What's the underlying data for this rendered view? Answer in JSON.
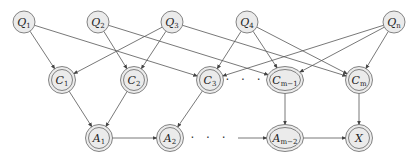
{
  "diagram": {
    "type": "directed-graph",
    "colors": {
      "node_fill": "#ebebeb",
      "stroke": "#666666",
      "edge": "#555555"
    },
    "nodes": [
      {
        "id": "Q1",
        "base": "Q",
        "sub": "1",
        "x": 24,
        "y": 22,
        "rx": 11,
        "ry": 11,
        "double": false
      },
      {
        "id": "Q2",
        "base": "Q",
        "sub": "2",
        "x": 98,
        "y": 22,
        "rx": 11,
        "ry": 11,
        "double": false
      },
      {
        "id": "Q3",
        "base": "Q",
        "sub": "3",
        "x": 172,
        "y": 22,
        "rx": 11,
        "ry": 11,
        "double": false
      },
      {
        "id": "Q4",
        "base": "Q",
        "sub": "4",
        "x": 247,
        "y": 22,
        "rx": 11,
        "ry": 11,
        "double": false
      },
      {
        "id": "Qn",
        "base": "Q",
        "sub": "n",
        "x": 394,
        "y": 22,
        "rx": 11,
        "ry": 11,
        "double": false
      },
      {
        "id": "C1",
        "base": "C",
        "sub": "1",
        "x": 62,
        "y": 80,
        "rx": 12,
        "ry": 12,
        "double": true
      },
      {
        "id": "C2",
        "base": "C",
        "sub": "2",
        "x": 134,
        "y": 80,
        "rx": 12,
        "ry": 12,
        "double": true
      },
      {
        "id": "C3",
        "base": "C",
        "sub": "3",
        "x": 210,
        "y": 80,
        "rx": 12,
        "ry": 12,
        "double": true
      },
      {
        "id": "Cm-1",
        "base": "C",
        "sub": "m−1",
        "x": 285,
        "y": 80,
        "rx": 17,
        "ry": 12,
        "double": true
      },
      {
        "id": "Cm",
        "base": "C",
        "sub": "m",
        "x": 359,
        "y": 80,
        "rx": 12,
        "ry": 12,
        "double": true
      },
      {
        "id": "A1",
        "base": "A",
        "sub": "1",
        "x": 99,
        "y": 138,
        "rx": 12,
        "ry": 12,
        "double": true
      },
      {
        "id": "A2",
        "base": "A",
        "sub": "2",
        "x": 170,
        "y": 138,
        "rx": 12,
        "ry": 12,
        "double": true
      },
      {
        "id": "Am-2",
        "base": "A",
        "sub": "m−2",
        "x": 285,
        "y": 138,
        "rx": 17,
        "ry": 12,
        "double": true
      },
      {
        "id": "X",
        "base": "X",
        "sub": "",
        "x": 359,
        "y": 138,
        "rx": 12,
        "ry": 12,
        "double": true
      }
    ],
    "edges": [
      [
        "Q1",
        "C1"
      ],
      [
        "Q1",
        "C3"
      ],
      [
        "Q2",
        "C2"
      ],
      [
        "Q2",
        "Cm-1"
      ],
      [
        "Q3",
        "C1"
      ],
      [
        "Q3",
        "C2"
      ],
      [
        "Q3",
        "Cm"
      ],
      [
        "Q4",
        "C3"
      ],
      [
        "Q4",
        "Cm-1"
      ],
      [
        "Q4",
        "Cm"
      ],
      [
        "Qn",
        "C3"
      ],
      [
        "Qn",
        "Cm-1"
      ],
      [
        "Qn",
        "Cm"
      ],
      [
        "C1",
        "A1"
      ],
      [
        "C2",
        "A1"
      ],
      [
        "C3",
        "A2"
      ],
      [
        "Cm-1",
        "Am-2"
      ],
      [
        "Cm",
        "X"
      ],
      [
        "A1",
        "A2"
      ],
      [
        "Am-2",
        "X"
      ]
    ],
    "free_edges": [
      {
        "from": [
          238,
          138
        ],
        "to": "Am-2"
      }
    ],
    "ellipses": [
      {
        "text": "· · ·",
        "x": 245,
        "y": 84
      },
      {
        "text": "· · ·",
        "x": 210,
        "y": 142
      }
    ]
  }
}
